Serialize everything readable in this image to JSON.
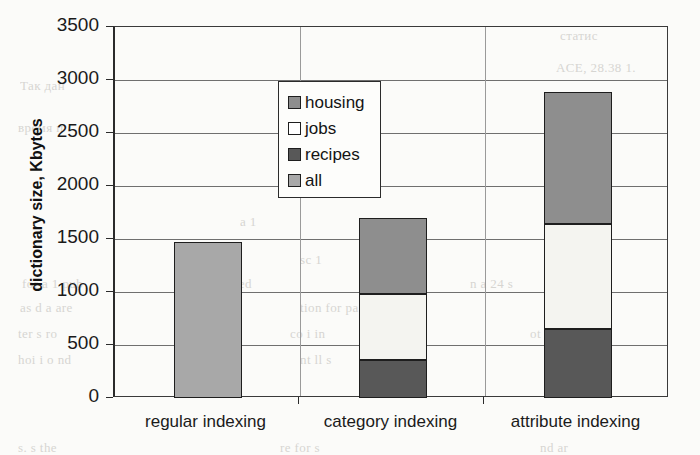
{
  "chart_data": {
    "type": "bar",
    "stacked": true,
    "title": "",
    "xlabel": "",
    "ylabel": "dictionary size, Kbytes",
    "categories": [
      "regular indexing",
      "category indexing",
      "attribute indexing"
    ],
    "series": [
      {
        "name": "all",
        "color": "#a8a8a8",
        "values": [
          1475,
          0,
          0
        ]
      },
      {
        "name": "recipes",
        "color": "#585858",
        "values": [
          0,
          360,
          655
        ]
      },
      {
        "name": "jobs",
        "color": "#f4f4f0",
        "values": [
          0,
          620,
          990
        ]
      },
      {
        "name": "housing",
        "color": "#8e8e8e",
        "values": [
          0,
          715,
          1240
        ]
      }
    ],
    "stack_order": [
      "all",
      "recipes",
      "jobs",
      "housing"
    ],
    "totals": [
      1475,
      1695,
      2885
    ],
    "ylim": [
      0,
      3500
    ],
    "ytick_labels": [
      "0",
      "500",
      "1000",
      "1500",
      "2000",
      "2500",
      "3000",
      "3500"
    ],
    "ytick_values": [
      0,
      500,
      1000,
      1500,
      2000,
      2500,
      3000,
      3500
    ],
    "grid": true,
    "legend_position": "upper-left-inside"
  },
  "legend": {
    "items": [
      {
        "label": "housing",
        "color": "#8e8e8e"
      },
      {
        "label": "jobs",
        "color": "#ffffff"
      },
      {
        "label": "recipes",
        "color": "#585858"
      },
      {
        "label": "all",
        "color": "#a8a8a8"
      }
    ]
  },
  "axes": {
    "y_title": "dictionary size, Kbytes",
    "y_ticks": [
      "3500",
      "3000",
      "2500",
      "2000",
      "1500",
      "1000",
      "500",
      "0"
    ],
    "x_ticks": [
      "regular indexing",
      "category indexing",
      "attribute indexing"
    ]
  },
  "ghost_text": [
    {
      "text": "статис",
      "x": 560,
      "y": 28
    },
    {
      "text": "ACE, 28.38 1.",
      "x": 556,
      "y": 60
    },
    {
      "text": "Так дан",
      "x": 20,
      "y": 78
    },
    {
      "text": "время п",
      "x": 18,
      "y": 120
    },
    {
      "text": "sion of the",
      "x": 300,
      "y": 182
    },
    {
      "text": "a 1",
      "x": 240,
      "y": 214
    },
    {
      "text": "sc 1",
      "x": 300,
      "y": 252
    },
    {
      "text": "for a 1 pub",
      "x": 22,
      "y": 276
    },
    {
      "text": "is prepared",
      "x": 190,
      "y": 276
    },
    {
      "text": "n a 24 s",
      "x": 470,
      "y": 276
    },
    {
      "text": "as d  a are",
      "x": 20,
      "y": 300
    },
    {
      "text": "tion for pa",
      "x": 300,
      "y": 300
    },
    {
      "text": "er p",
      "x": 560,
      "y": 300
    },
    {
      "text": "ter s ro",
      "x": 18,
      "y": 326
    },
    {
      "text": "co  i in",
      "x": 290,
      "y": 326
    },
    {
      "text": "ot  he",
      "x": 530,
      "y": 326
    },
    {
      "text": "hoi i  o   nd",
      "x": 18,
      "y": 352
    },
    {
      "text": "nt  ll  s",
      "x": 300,
      "y": 352
    },
    {
      "text": "ed",
      "x": 560,
      "y": 352
    },
    {
      "text": "s. s  the",
      "x": 18,
      "y": 440
    },
    {
      "text": "re  for s",
      "x": 280,
      "y": 440
    },
    {
      "text": "nd  ar",
      "x": 540,
      "y": 440
    }
  ]
}
